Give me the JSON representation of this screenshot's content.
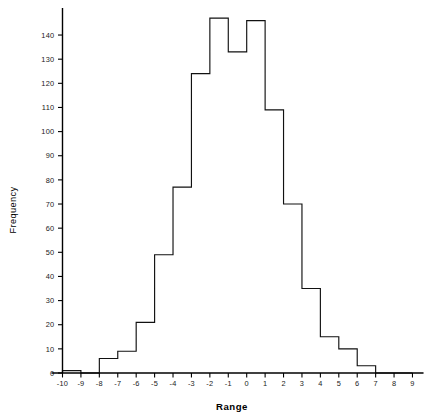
{
  "chart_data": {
    "type": "bar",
    "title": "",
    "subtitle": "",
    "xlabel": "Range",
    "ylabel": "Frequency",
    "bin_width": 1,
    "bin_edges": [
      -10,
      -9,
      -8,
      -7,
      -6,
      -5,
      -4,
      -3,
      -2,
      -1,
      0,
      1,
      2,
      3,
      4,
      5,
      6,
      7,
      8,
      9
    ],
    "categories": [
      "-10 to -9",
      "-9 to -8",
      "-8 to -7",
      "-7 to -6",
      "-6 to -5",
      "-5 to -4",
      "-4 to -3",
      "-3 to -2",
      "-2 to -1",
      "-1 to 0",
      "0 to 1",
      "1 to 2",
      "2 to 3",
      "3 to 4",
      "4 to 5",
      "5 to 6",
      "6 to 7",
      "7 to 8",
      "8 to 9"
    ],
    "values": [
      1,
      0,
      6,
      9,
      21,
      49,
      77,
      124,
      147,
      133,
      146,
      109,
      70,
      35,
      15,
      10,
      3,
      0,
      0
    ],
    "xlim": [
      -10.6,
      9.6
    ],
    "ylim": [
      0,
      150
    ],
    "xticks": [
      -10,
      -9,
      -8,
      -7,
      -6,
      -5,
      -4,
      -3,
      -2,
      -1,
      0,
      1,
      2,
      3,
      4,
      5,
      6,
      7,
      8,
      9
    ],
    "xtick_labels": [
      "-10",
      "-9",
      "-8",
      "-7",
      "-6",
      "-5",
      "-4",
      "-3",
      "-2",
      "-1",
      "0",
      "1",
      "2",
      "3",
      "4",
      "5",
      "6",
      "7",
      "8",
      "9"
    ],
    "yticks": [
      0,
      10,
      20,
      30,
      40,
      50,
      60,
      70,
      80,
      90,
      100,
      110,
      120,
      130,
      140
    ],
    "ytick_labels": [
      "0",
      "10",
      "20",
      "30",
      "40",
      "50",
      "60",
      "70",
      "80",
      "90",
      "100",
      "110",
      "120",
      "130",
      "140"
    ],
    "grid": false,
    "legend": null,
    "bar_fill": "#ffffff",
    "bar_stroke": "#111111",
    "axis_color": "#000000"
  }
}
